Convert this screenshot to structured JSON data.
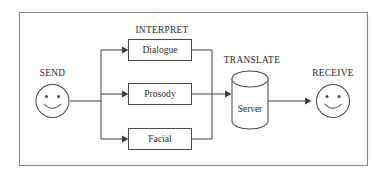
{
  "diagram": {
    "frame": {
      "name": "outer-border"
    },
    "colors": {
      "background": "#fdfdfc",
      "stroke": "#4a4a4a",
      "frame_stroke": "#8a8a8a",
      "text": "#2b2b2b",
      "box_fill": "#ffffff"
    },
    "group_labels": {
      "interpret": "INTERPRET",
      "translate": "TRANSLATE"
    },
    "endpoints": {
      "send": {
        "label": "SEND",
        "icon": "smiley-face-icon"
      },
      "receive": {
        "label": "RECEIVE",
        "icon": "smiley-face-icon"
      }
    },
    "process_boxes": [
      {
        "id": "dialogue",
        "label": "Dialogue"
      },
      {
        "id": "prosody",
        "label": "Prosody"
      },
      {
        "id": "facial",
        "label": "Facial"
      }
    ],
    "datastore": {
      "id": "server",
      "label": "Server",
      "shape": "cylinder"
    },
    "connectors": [
      {
        "id": "send-to-split",
        "from": "send",
        "to": "split-bus",
        "arrow": false
      },
      {
        "id": "split-to-dialogue",
        "from": "split-bus",
        "to": "dialogue",
        "arrow": true
      },
      {
        "id": "split-to-prosody",
        "from": "split-bus",
        "to": "prosody",
        "arrow": true
      },
      {
        "id": "split-to-facial",
        "from": "split-bus",
        "to": "facial",
        "arrow": true
      },
      {
        "id": "dialogue-to-merge",
        "from": "dialogue",
        "to": "merge-bus",
        "arrow": false
      },
      {
        "id": "prosody-to-server",
        "from": "merge-bus",
        "to": "server",
        "arrow": true
      },
      {
        "id": "facial-to-merge",
        "from": "facial",
        "to": "merge-bus",
        "arrow": false
      },
      {
        "id": "server-to-receive",
        "from": "server",
        "to": "receive",
        "arrow": true
      }
    ]
  }
}
